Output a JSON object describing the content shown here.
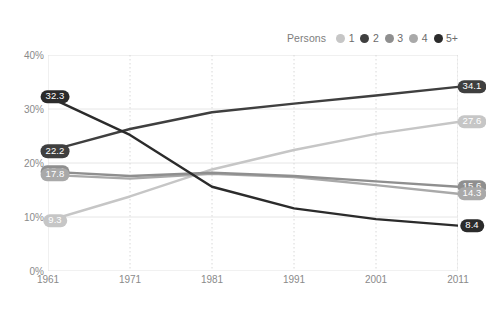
{
  "legend": {
    "title": "Persons",
    "items": [
      {
        "label": "1",
        "color": "#c6c6c6"
      },
      {
        "label": "2",
        "color": "#3f3f3f"
      },
      {
        "label": "3",
        "color": "#8f8f8f"
      },
      {
        "label": "4",
        "color": "#a9a9a9"
      },
      {
        "label": "5+",
        "color": "#2b2b2b"
      }
    ]
  },
  "chart_data": {
    "type": "line",
    "title": "",
    "xlabel": "",
    "ylabel": "",
    "x": [
      1961,
      1971,
      1981,
      1991,
      2001,
      2011
    ],
    "categories": [
      "1961",
      "1971",
      "1981",
      "1991",
      "2001",
      "2011"
    ],
    "xlim": [
      1961,
      2011
    ],
    "ylim": [
      0,
      40
    ],
    "yticks": [
      0,
      10,
      20,
      30,
      40
    ],
    "ytick_labels": [
      "0%",
      "10%",
      "20%",
      "30%",
      "40%"
    ],
    "xticks": [
      1961,
      1971,
      1981,
      1991,
      2001,
      2011
    ],
    "xtick_labels": [
      "1961",
      "1971",
      "1981",
      "1991",
      "2001",
      "2011"
    ],
    "grid": true,
    "legend_position": "top-right",
    "series": [
      {
        "name": "1",
        "color": "#c6c6c6",
        "values": [
          9.3,
          13.8,
          18.8,
          22.4,
          25.4,
          27.6
        ],
        "start_label": "9.3",
        "end_label": "27.6"
      },
      {
        "name": "2",
        "color": "#3f3f3f",
        "values": [
          22.2,
          26.3,
          29.4,
          31.0,
          32.5,
          34.1
        ],
        "start_label": "22.2",
        "end_label": "34.1"
      },
      {
        "name": "3",
        "color": "#8f8f8f",
        "values": [
          18.4,
          17.6,
          18.2,
          17.6,
          16.6,
          15.6
        ],
        "start_label": "18.4",
        "end_label": "15.6"
      },
      {
        "name": "4",
        "color": "#a9a9a9",
        "values": [
          17.8,
          17.1,
          18.0,
          17.4,
          15.9,
          14.3
        ],
        "start_label": "17.8",
        "end_label": "14.3"
      },
      {
        "name": "5+",
        "color": "#2b2b2b",
        "values": [
          32.3,
          25.2,
          15.6,
          11.6,
          9.6,
          8.4
        ],
        "start_label": "32.3",
        "end_label": "8.4"
      }
    ]
  }
}
